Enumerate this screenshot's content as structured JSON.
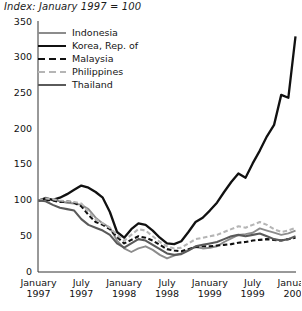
{
  "chart_data": {
    "type": "line",
    "title": "Index: January 1997 = 100",
    "xlabel": "",
    "ylabel": "",
    "ylim": [
      0,
      350
    ],
    "yticks": [
      0,
      50,
      100,
      150,
      200,
      250,
      300,
      350
    ],
    "xticks": [
      {
        "month": "January",
        "year": "1997"
      },
      {
        "month": "July",
        "year": "1997"
      },
      {
        "month": "January",
        "year": "1998"
      },
      {
        "month": "July",
        "year": "1998"
      },
      {
        "month": "January",
        "year": "1999"
      },
      {
        "month": "July",
        "year": "1999"
      },
      {
        "month": "January",
        "year": "2000"
      }
    ],
    "grid": false,
    "legend_position": "upper-left-inside",
    "x": [
      "1997-01",
      "1997-02",
      "1997-03",
      "1997-04",
      "1997-05",
      "1997-06",
      "1997-07",
      "1997-08",
      "1997-09",
      "1997-10",
      "1997-11",
      "1997-12",
      "1998-01",
      "1998-02",
      "1998-03",
      "1998-04",
      "1998-05",
      "1998-06",
      "1998-07",
      "1998-08",
      "1998-09",
      "1998-10",
      "1998-11",
      "1998-12",
      "1999-01",
      "1999-02",
      "1999-03",
      "1999-04",
      "1999-05",
      "1999-06",
      "1999-07",
      "1999-08",
      "1999-09",
      "1999-10",
      "1999-11",
      "1999-12",
      "2000-01"
    ],
    "series": [
      {
        "name": "Indonesia",
        "color": "#8c8c8c",
        "style": "solid",
        "width": 1.9,
        "values": [
          100,
          104,
          101,
          99,
          97,
          96,
          94,
          88,
          76,
          68,
          62,
          44,
          33,
          28,
          33,
          36,
          31,
          24,
          19,
          23,
          26,
          31,
          35,
          33,
          34,
          36,
          42,
          47,
          52,
          53,
          55,
          61,
          58,
          55,
          52,
          54,
          58
        ]
      },
      {
        "name": "Korea, Rep. of",
        "color": "#111111",
        "style": "solid",
        "width": 2.3,
        "values": [
          100,
          103,
          101,
          104,
          109,
          115,
          121,
          118,
          112,
          104,
          84,
          56,
          48,
          60,
          68,
          66,
          58,
          48,
          40,
          39,
          43,
          56,
          70,
          76,
          86,
          97,
          112,
          126,
          138,
          132,
          152,
          170,
          190,
          206,
          248,
          244,
          330
        ]
      },
      {
        "name": "Malaysia",
        "color": "#111111",
        "style": "dashed",
        "width": 2.1,
        "values": [
          100,
          101,
          100,
          98,
          99,
          97,
          92,
          80,
          70,
          66,
          60,
          49,
          40,
          45,
          50,
          48,
          44,
          38,
          32,
          30,
          29,
          32,
          35,
          36,
          36,
          37,
          38,
          39,
          41,
          42,
          44,
          45,
          46,
          45,
          44,
          46,
          48
        ]
      },
      {
        "name": "Philippines",
        "color": "#b5b5b5",
        "style": "dashed",
        "width": 2.1,
        "values": [
          100,
          103,
          102,
          100,
          99,
          98,
          96,
          84,
          74,
          68,
          62,
          52,
          44,
          52,
          60,
          58,
          50,
          42,
          36,
          33,
          34,
          40,
          46,
          48,
          50,
          52,
          56,
          60,
          64,
          62,
          66,
          70,
          66,
          60,
          56,
          58,
          62
        ]
      },
      {
        "name": "Thailand",
        "color": "#5a5a5a",
        "style": "solid",
        "width": 2.1,
        "values": [
          100,
          99,
          94,
          90,
          88,
          86,
          74,
          66,
          62,
          58,
          52,
          40,
          34,
          40,
          46,
          44,
          38,
          32,
          26,
          24,
          25,
          30,
          36,
          38,
          40,
          42,
          46,
          50,
          52,
          50,
          52,
          54,
          50,
          46,
          44,
          46,
          50
        ]
      }
    ]
  }
}
